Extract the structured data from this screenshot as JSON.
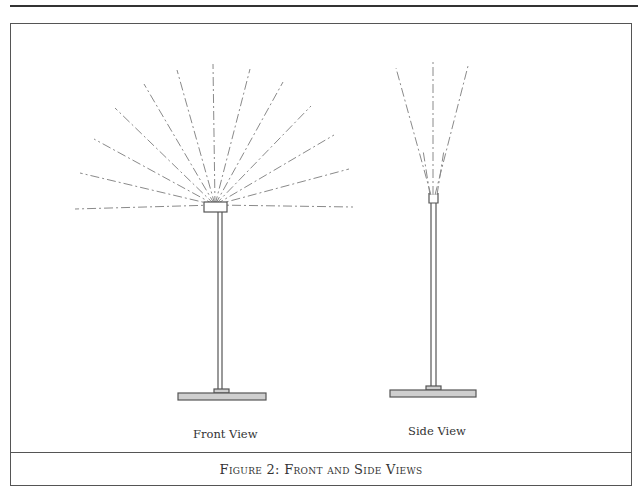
{
  "figure": {
    "caption": "Figure 2: Front and Side Views",
    "views": [
      {
        "label": "Front View"
      },
      {
        "label": "Side View"
      }
    ]
  },
  "colors": {
    "line": "#555555",
    "dash": "#8a8a8a",
    "base_fill": "#cfcfcf"
  }
}
